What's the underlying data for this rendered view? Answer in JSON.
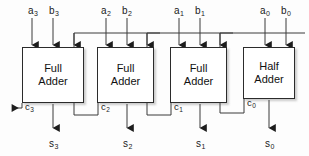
{
  "diagram": {
    "wire_color": "#3a3a3a",
    "box_border_color": "#2b2b2b",
    "box_fill_color": "#ffffff",
    "background_color": "#fdfdfd",
    "blocks": [
      {
        "id": "fa3",
        "line1": "Full",
        "line2": "Adder",
        "x": 22,
        "y": 47,
        "w": 62,
        "h": 56
      },
      {
        "id": "fa2",
        "line1": "Full",
        "line2": "Adder",
        "x": 97,
        "y": 47,
        "w": 57,
        "h": 56
      },
      {
        "id": "fa1",
        "line1": "Full",
        "line2": "Adder",
        "x": 170,
        "y": 47,
        "w": 57,
        "h": 56
      },
      {
        "id": "ha0",
        "line1": "Half",
        "line2": "Adder",
        "x": 243,
        "y": 47,
        "w": 52,
        "h": 52
      }
    ],
    "input_labels": [
      {
        "id": "a3",
        "text": "a",
        "sub": "3",
        "x": 28,
        "y": 5
      },
      {
        "id": "b3",
        "text": "b",
        "sub": "3",
        "x": 49,
        "y": 5
      },
      {
        "id": "a2",
        "text": "a",
        "sub": "2",
        "x": 101,
        "y": 5
      },
      {
        "id": "b2",
        "text": "b",
        "sub": "2",
        "x": 122,
        "y": 5
      },
      {
        "id": "a1",
        "text": "a",
        "sub": "1",
        "x": 174,
        "y": 5
      },
      {
        "id": "b1",
        "text": "b",
        "sub": "1",
        "x": 195,
        "y": 5
      },
      {
        "id": "a0",
        "text": "a",
        "sub": "0",
        "x": 260,
        "y": 5
      },
      {
        "id": "b0",
        "text": "b",
        "sub": "0",
        "x": 281,
        "y": 5
      }
    ],
    "carry_labels": [
      {
        "id": "c3",
        "text": "c",
        "sub": "3",
        "x": 22,
        "y": 101
      },
      {
        "id": "c2",
        "text": "c",
        "sub": "2",
        "x": 98,
        "y": 101
      },
      {
        "id": "c1",
        "text": "c",
        "sub": "1",
        "x": 171,
        "y": 101
      },
      {
        "id": "c0",
        "text": "c",
        "sub": "0",
        "x": 244,
        "y": 99
      }
    ],
    "sum_labels": [
      {
        "id": "s3",
        "text": "s",
        "sub": "3",
        "x": 50,
        "y": 138
      },
      {
        "id": "s2",
        "text": "s",
        "sub": "2",
        "x": 121,
        "y": 138
      },
      {
        "id": "s1",
        "text": "s",
        "sub": "1",
        "x": 194,
        "y": 138
      },
      {
        "id": "s0",
        "text": "s",
        "sub": "0",
        "x": 266,
        "y": 138
      }
    ]
  }
}
